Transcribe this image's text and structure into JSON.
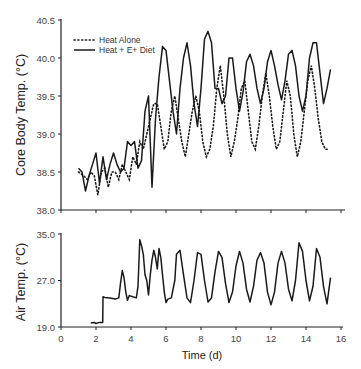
{
  "chart_data": [
    {
      "type": "line",
      "title": "",
      "xlabel": "",
      "ylabel": "Core Body Temp. (°C)",
      "xlim": [
        0,
        16
      ],
      "ylim": [
        38.0,
        40.5
      ],
      "yticks": [
        "38.0",
        "38.5",
        "39.0",
        "39.5",
        "40.0",
        "40.5"
      ],
      "xticks": [
        0,
        2,
        4,
        6,
        8,
        10,
        12,
        14,
        16
      ],
      "grid": false,
      "legend_position": "upper-left",
      "series": [
        {
          "name": "Heat Alone",
          "style": "dotted",
          "x": [
            1.0,
            1.3,
            1.5,
            1.7,
            1.9,
            2.1,
            2.3,
            2.5,
            2.7,
            2.9,
            3.1,
            3.3,
            3.5,
            3.7,
            3.9,
            4.1,
            4.3,
            4.5,
            4.7,
            4.9,
            5.1,
            5.3,
            5.5,
            5.7,
            5.9,
            6.1,
            6.3,
            6.5,
            6.7,
            6.9,
            7.1,
            7.3,
            7.5,
            7.7,
            7.9,
            8.1,
            8.3,
            8.5,
            8.7,
            8.9,
            9.1,
            9.3,
            9.5,
            9.7,
            9.9,
            10.1,
            10.3,
            10.5,
            10.7,
            10.9,
            11.1,
            11.3,
            11.5,
            11.7,
            11.9,
            12.1,
            12.3,
            12.5,
            12.7,
            12.9,
            13.1,
            13.3,
            13.5,
            13.7,
            13.9,
            14.1,
            14.3,
            14.5,
            14.7,
            14.9,
            15.1,
            15.3
          ],
          "y": [
            38.5,
            38.45,
            38.4,
            38.5,
            38.45,
            38.2,
            38.5,
            38.55,
            38.3,
            38.5,
            38.5,
            38.4,
            38.6,
            38.5,
            38.4,
            38.7,
            38.6,
            38.9,
            38.8,
            39.0,
            39.2,
            39.4,
            39.4,
            39.1,
            38.8,
            38.9,
            39.3,
            39.5,
            39.2,
            38.9,
            38.7,
            39.0,
            39.3,
            39.5,
            39.3,
            38.9,
            38.7,
            38.8,
            39.1,
            39.6,
            39.9,
            39.5,
            39.0,
            38.7,
            38.9,
            39.2,
            39.6,
            39.7,
            39.3,
            38.9,
            38.8,
            39.1,
            39.5,
            39.8,
            39.5,
            39.1,
            38.8,
            38.9,
            39.3,
            39.7,
            39.5,
            39.0,
            38.7,
            38.9,
            39.3,
            39.7,
            39.9,
            39.6,
            39.2,
            38.9,
            38.8,
            38.8
          ]
        },
        {
          "name": "Heat + E+ Diet",
          "style": "solid",
          "x": [
            1.0,
            1.2,
            1.4,
            1.6,
            1.8,
            2.0,
            2.2,
            2.4,
            2.6,
            2.8,
            3.0,
            3.2,
            3.4,
            3.6,
            3.8,
            4.0,
            4.2,
            4.4,
            4.6,
            4.8,
            5.0,
            5.2,
            5.4,
            5.6,
            5.8,
            6.0,
            6.2,
            6.4,
            6.6,
            6.8,
            7.0,
            7.2,
            7.4,
            7.6,
            7.8,
            8.0,
            8.2,
            8.4,
            8.6,
            8.8,
            9.0,
            9.2,
            9.4,
            9.6,
            9.8,
            10.0,
            10.2,
            10.4,
            10.6,
            10.8,
            11.0,
            11.2,
            11.4,
            11.6,
            11.8,
            12.0,
            12.2,
            12.4,
            12.6,
            12.8,
            13.0,
            13.2,
            13.4,
            13.6,
            13.8,
            14.0,
            14.2,
            14.4,
            14.6,
            14.8,
            15.0,
            15.2,
            15.4
          ],
          "y": [
            38.55,
            38.5,
            38.25,
            38.45,
            38.6,
            38.75,
            38.35,
            38.7,
            38.4,
            38.6,
            38.75,
            38.6,
            38.5,
            38.55,
            38.9,
            38.85,
            38.9,
            38.55,
            38.65,
            39.3,
            39.5,
            38.3,
            39.2,
            39.75,
            40.15,
            40.1,
            39.7,
            39.3,
            39.0,
            39.6,
            40.0,
            40.2,
            39.9,
            39.4,
            39.1,
            39.6,
            40.25,
            40.35,
            40.2,
            39.6,
            39.6,
            39.4,
            39.5,
            40.0,
            40.0,
            39.6,
            39.3,
            39.55,
            39.95,
            40.05,
            39.9,
            39.6,
            39.4,
            39.6,
            39.95,
            40.1,
            39.9,
            39.65,
            39.45,
            39.7,
            40.05,
            40.1,
            39.9,
            39.5,
            39.3,
            39.5,
            40.0,
            40.2,
            40.2,
            39.8,
            39.4,
            39.6,
            39.85
          ]
        }
      ]
    },
    {
      "type": "line",
      "title": "",
      "xlabel": "Time (d)",
      "ylabel": "Air Temp. (°C)",
      "xlim": [
        0,
        16
      ],
      "ylim": [
        19.0,
        35.0
      ],
      "yticks": [
        "19.0",
        "27.0",
        "35.0"
      ],
      "xticks": [
        0,
        2,
        4,
        6,
        8,
        10,
        12,
        14,
        16
      ],
      "grid": false,
      "series": [
        {
          "name": "Air Temp",
          "style": "solid",
          "x": [
            1.7,
            1.9,
            2.0,
            2.1,
            2.2,
            2.38,
            2.4,
            2.5,
            2.8,
            3.1,
            3.3,
            3.4,
            3.5,
            3.6,
            3.7,
            3.8,
            3.9,
            4.1,
            4.3,
            4.4,
            4.5,
            4.6,
            4.7,
            4.8,
            4.9,
            5.0,
            5.1,
            5.2,
            5.3,
            5.4,
            5.5,
            5.6,
            5.7,
            5.8,
            5.9,
            6.0,
            6.1,
            6.3,
            6.5,
            6.6,
            6.8,
            7.0,
            7.2,
            7.4,
            7.6,
            7.8,
            8.0,
            8.2,
            8.4,
            8.6,
            8.8,
            9.0,
            9.2,
            9.4,
            9.6,
            9.8,
            10.0,
            10.2,
            10.4,
            10.6,
            10.8,
            11.0,
            11.2,
            11.4,
            11.6,
            11.8,
            12.0,
            12.2,
            12.4,
            12.6,
            12.8,
            13.0,
            13.2,
            13.4,
            13.6,
            13.8,
            14.0,
            14.2,
            14.4,
            14.6,
            14.8,
            15.0,
            15.2,
            15.4
          ],
          "y": [
            19.7,
            19.8,
            19.6,
            19.7,
            19.8,
            19.8,
            24.2,
            24.1,
            24.0,
            23.8,
            24.0,
            26.5,
            28.7,
            27.5,
            25.0,
            23.6,
            24.4,
            24.2,
            24.0,
            26.0,
            34.0,
            33.0,
            31.5,
            28.0,
            27.0,
            24.5,
            28.0,
            30.5,
            32.2,
            31.0,
            29.0,
            32.5,
            31.0,
            28.0,
            25.0,
            23.2,
            23.8,
            24.0,
            27.0,
            31.5,
            32.2,
            28.0,
            24.0,
            23.2,
            27.0,
            31.8,
            31.5,
            27.0,
            23.3,
            24.0,
            28.5,
            32.0,
            31.0,
            26.5,
            23.2,
            25.0,
            29.5,
            32.0,
            30.0,
            25.5,
            23.3,
            26.0,
            30.5,
            31.8,
            30.0,
            25.0,
            22.8,
            25.0,
            30.0,
            32.0,
            30.0,
            25.5,
            23.5,
            27.0,
            33.5,
            32.0,
            27.0,
            23.5,
            26.0,
            32.5,
            31.0,
            26.0,
            23.0,
            27.5
          ]
        }
      ]
    }
  ],
  "top_chart": {
    "y_axis_title": "Core Body Temp. (°C)",
    "y_ticks": [
      "38.0",
      "38.5",
      "39.0",
      "39.5",
      "40.0",
      "40.5"
    ],
    "legend": [
      {
        "label": "Heat Alone",
        "style": "dotted"
      },
      {
        "label": "Heat + E+ Diet",
        "style": "solid"
      }
    ]
  },
  "bottom_chart": {
    "y_axis_title": "Air Temp. (°C)",
    "y_ticks": [
      "19.0",
      "27.0",
      "35.0"
    ],
    "x_ticks": [
      "0",
      "2",
      "4",
      "6",
      "8",
      "10",
      "12",
      "14",
      "16"
    ],
    "x_axis_title": "Time (d)"
  },
  "colors": {
    "line": "#1a1a1a",
    "axis": "#222222",
    "text": "#333333"
  }
}
